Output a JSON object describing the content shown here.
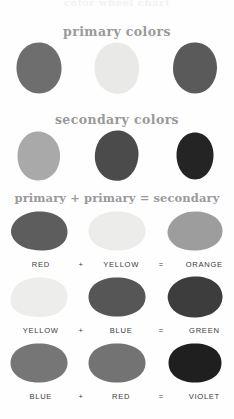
{
  "page": {
    "top_partial_text": "color wheel chart",
    "background_color": "#fefefe"
  },
  "sections": {
    "primary": {
      "heading": "primary colors",
      "swatches": [
        {
          "name": "red",
          "gray_hex": "#6e6e6e"
        },
        {
          "name": "yellow",
          "gray_hex": "#e9e9e7"
        },
        {
          "name": "blue",
          "gray_hex": "#5a5a5a"
        }
      ]
    },
    "secondary": {
      "heading": "secondary colors",
      "swatches": [
        {
          "name": "orange",
          "gray_hex": "#a9a9a9"
        },
        {
          "name": "green",
          "gray_hex": "#4b4b4b"
        },
        {
          "name": "violet",
          "gray_hex": "#242424"
        }
      ]
    },
    "equations": {
      "heading": "primary + primary = secondary",
      "plus_symbol": "+",
      "equals_symbol": "=",
      "rows": [
        {
          "term1": "RED",
          "term1_gray": "#5d5d5d",
          "term2": "YELLOW",
          "term2_gray": "#ececea",
          "result": "ORANGE",
          "result_gray": "#9d9d9d"
        },
        {
          "term1": "YELLOW",
          "term1_gray": "#ededeb",
          "term2": "BLUE",
          "term2_gray": "#565656",
          "result": "GREEN",
          "result_gray": "#3d3d3d"
        },
        {
          "term1": "BLUE",
          "term1_gray": "#767676",
          "term2": "RED",
          "term2_gray": "#737373",
          "result": "VIOLET",
          "result_gray": "#1f1f1f"
        }
      ]
    }
  },
  "colors": {
    "heading_text": "#9a9a9a",
    "label_text": "#3b3b3b",
    "page_background": "#fefefe"
  }
}
